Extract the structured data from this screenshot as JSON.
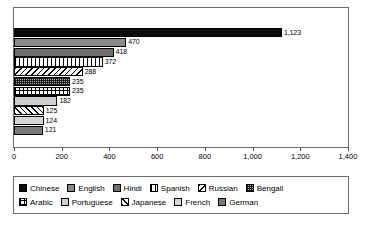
{
  "chart_data": {
    "type": "bar",
    "orientation": "horizontal",
    "title": "",
    "subtitle": "",
    "xlabel": "",
    "ylabel": "",
    "xlim": [
      0,
      1400
    ],
    "grid": false,
    "legend_position": "bottom",
    "categories": [
      "Chinese",
      "English",
      "Hindi",
      "Spanish",
      "Russian",
      "Bengali",
      "Arabic",
      "Portuguese",
      "Japanese",
      "French",
      "German"
    ],
    "values": [
      1123,
      470,
      418,
      372,
      288,
      235,
      235,
      182,
      125,
      124,
      121
    ],
    "data_labels": [
      "1,123",
      "470",
      "418",
      "372",
      "288",
      "235",
      "235",
      "182",
      "125",
      "124",
      "121"
    ],
    "xticks": [
      0,
      200,
      400,
      600,
      800,
      1000,
      1200,
      1400
    ],
    "xtick_labels": [
      "0",
      "200",
      "400",
      "600",
      "800",
      "1,000",
      "1,200",
      "1,400"
    ],
    "series": [
      {
        "name": "Languages",
        "values": [
          1123,
          470,
          418,
          372,
          288,
          235,
          235,
          182,
          125,
          124,
          121
        ]
      }
    ]
  },
  "bars": [
    {
      "label": "Chinese",
      "value": 1123,
      "display": "1,123",
      "pattern": "p-solid-black"
    },
    {
      "label": "English",
      "value": 470,
      "display": "470",
      "pattern": "p-gray-med"
    },
    {
      "label": "Hindi",
      "value": 418,
      "display": "418",
      "pattern": "p-gray-dark"
    },
    {
      "label": "Spanish",
      "value": 372,
      "display": "372",
      "pattern": "p-vstripe"
    },
    {
      "label": "Russian",
      "value": 288,
      "display": "288",
      "pattern": "p-diag"
    },
    {
      "label": "Bengali",
      "value": 235,
      "display": "235",
      "pattern": "p-checker"
    },
    {
      "label": "Arabic",
      "value": 235,
      "display": "235",
      "pattern": "p-grid"
    },
    {
      "label": "Portuguese",
      "value": 182,
      "display": "182",
      "pattern": "p-gray-light"
    },
    {
      "label": "Japanese",
      "value": 125,
      "display": "125",
      "pattern": "p-diag2"
    },
    {
      "label": "French",
      "value": 124,
      "display": "124",
      "pattern": "p-gray-light2"
    },
    {
      "label": "German",
      "value": 121,
      "display": "121",
      "pattern": "p-gray-dark2"
    }
  ],
  "axis": {
    "ticks": [
      "0",
      "200",
      "400",
      "600",
      "800",
      "1,000",
      "1,200",
      "1,400"
    ]
  },
  "legend": {
    "rows": [
      [
        {
          "label": "Chinese",
          "pattern": "p-solid-black"
        },
        {
          "label": "English",
          "pattern": "p-gray-med"
        },
        {
          "label": "Hindi",
          "pattern": "p-gray-dark"
        },
        {
          "label": "Spanish",
          "pattern": "p-vstripe"
        },
        {
          "label": "Russian",
          "pattern": "p-diag"
        },
        {
          "label": "Bengali",
          "pattern": "p-checker"
        }
      ],
      [
        {
          "label": "Arabic",
          "pattern": "p-grid"
        },
        {
          "label": "Portuguese",
          "pattern": "p-gray-light"
        },
        {
          "label": "Japanese",
          "pattern": "p-diag2"
        },
        {
          "label": "French",
          "pattern": "p-gray-light2"
        },
        {
          "label": "German",
          "pattern": "p-gray-dark2"
        }
      ]
    ]
  },
  "colors": {
    "frame": "#6a6a6a",
    "text": "#000000",
    "background": "#ffffff"
  }
}
